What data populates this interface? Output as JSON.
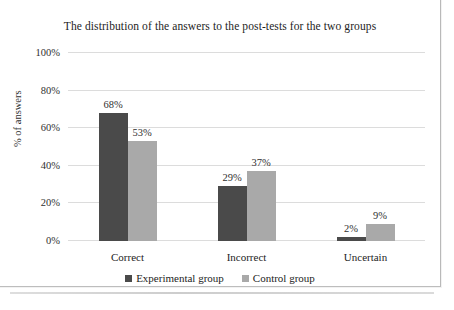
{
  "chart_data": {
    "type": "bar",
    "title": "The distribution of the answers to the post-tests for the two groups",
    "xlabel": "",
    "ylabel": "% of answers",
    "categories": [
      "Correct",
      "Incorrect",
      "Uncertain"
    ],
    "series": [
      {
        "name": "Experimental group",
        "color": "#4a4a4a",
        "values": [
          68,
          29,
          2
        ],
        "labels": [
          "68%",
          "29%",
          "2%"
        ]
      },
      {
        "name": "Control group",
        "color": "#a9a9a9",
        "values": [
          53,
          37,
          9
        ],
        "labels": [
          "53%",
          "37%",
          "9%"
        ]
      }
    ],
    "ylim": [
      0,
      100
    ],
    "yticks": [
      0,
      20,
      40,
      60,
      80,
      100
    ],
    "ytick_labels": [
      "0%",
      "20%",
      "40%",
      "60%",
      "80%",
      "100%"
    ],
    "grid": true,
    "legend_position": "bottom"
  }
}
